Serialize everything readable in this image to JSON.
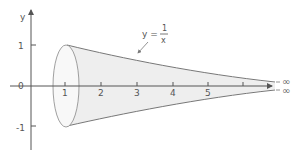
{
  "diagram": {
    "axes": {
      "x_label": "x",
      "y_label": "y",
      "x_ticks": [
        "1",
        "2",
        "3",
        "4",
        "5"
      ],
      "y_ticks": [
        "1",
        "0",
        "-1"
      ]
    },
    "curve_label": {
      "lhs": "y =",
      "numerator": "1",
      "denominator": "x"
    },
    "infinity_labels": [
      "∞",
      "∞"
    ],
    "colors": {
      "axis": "#555555",
      "curve": "#777777",
      "fill": "#eeeeee",
      "text": "#555555"
    }
  }
}
